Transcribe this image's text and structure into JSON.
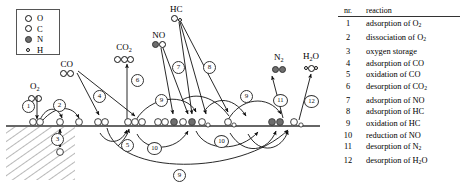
{
  "figure": {
    "type": "mechanism-diagram"
  },
  "legend": {
    "items": [
      {
        "symbol": "O",
        "kind": "open-circle"
      },
      {
        "symbol": "C",
        "kind": "open-circle"
      },
      {
        "symbol": "N",
        "kind": "filled-circle"
      },
      {
        "symbol": "H",
        "kind": "small-open-circle"
      }
    ]
  },
  "table": {
    "headers": {
      "nr": "nr.",
      "reaction": "reaction"
    },
    "rows": [
      {
        "nr": "1",
        "reaction": "adsorption of O",
        "sub": "2"
      },
      {
        "nr": "2",
        "reaction": "dissociation of O",
        "sub": "2"
      },
      {
        "nr": "3",
        "reaction": "oxygen storage",
        "sub": ""
      },
      {
        "nr": "4",
        "reaction": "adsorption of CO",
        "sub": ""
      },
      {
        "nr": "5",
        "reaction": "oxidation of CO",
        "sub": ""
      },
      {
        "nr": "6",
        "reaction": "desorption of CO",
        "sub": "2"
      },
      {
        "nr": "7",
        "reaction": "adsorption of NO",
        "sub": ""
      },
      {
        "nr": "8",
        "reaction": "adsorption of HC",
        "sub": ""
      },
      {
        "nr": "9",
        "reaction": "oxidation of HC",
        "sub": ""
      },
      {
        "nr": "10",
        "reaction": "reduction of NO",
        "sub": ""
      },
      {
        "nr": "11",
        "reaction": "desorption of N",
        "sub": "2"
      },
      {
        "nr": "12",
        "reaction": "desorption of H",
        "sub": "2O"
      }
    ]
  },
  "molecules": [
    {
      "name": "O2",
      "label": "O",
      "sub": "2",
      "x": 31,
      "y": 83
    },
    {
      "name": "CO",
      "label": "CO",
      "sub": "",
      "x": 62,
      "y": 61
    },
    {
      "name": "CO2",
      "label": "CO",
      "sub": "2",
      "x": 119,
      "y": 44
    },
    {
      "name": "NO",
      "label": "NO",
      "sub": "",
      "x": 156,
      "y": 31
    },
    {
      "name": "HC",
      "label": "HC",
      "sub": "",
      "x": 172,
      "y": 5
    },
    {
      "name": "N2",
      "label": "N",
      "sub": "2",
      "x": 275,
      "y": 54
    },
    {
      "name": "H2O",
      "label": "H",
      "sub": "2",
      "label2": "O",
      "x": 308,
      "y": 52
    }
  ],
  "step_markers": [
    {
      "nr": "1",
      "x": 22,
      "y": 100
    },
    {
      "nr": "2",
      "x": 53,
      "y": 99
    },
    {
      "nr": "3",
      "x": 51,
      "y": 133
    },
    {
      "nr": "4",
      "x": 93,
      "y": 90
    },
    {
      "nr": "5",
      "x": 121,
      "y": 139
    },
    {
      "nr": "6",
      "x": 131,
      "y": 74
    },
    {
      "nr": "7",
      "x": 172,
      "y": 61
    },
    {
      "nr": "8",
      "x": 203,
      "y": 61
    },
    {
      "nr": "9",
      "x": 155,
      "y": 94
    },
    {
      "nr": "9",
      "x": 240,
      "y": 90
    },
    {
      "nr": "10",
      "x": 148,
      "y": 142
    },
    {
      "nr": "10",
      "x": 215,
      "y": 135
    },
    {
      "nr": "11",
      "x": 274,
      "y": 94
    },
    {
      "nr": "12",
      "x": 305,
      "y": 95
    },
    {
      "nr": "9",
      "x": 174,
      "y": 170
    }
  ],
  "surface": {
    "line_y": 125,
    "label": "catalyst-surface"
  }
}
